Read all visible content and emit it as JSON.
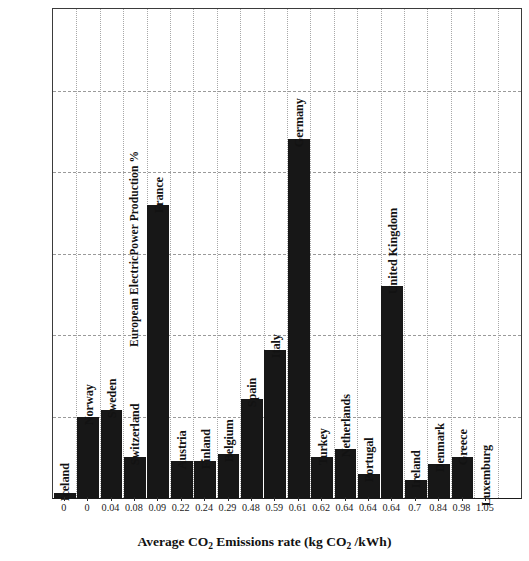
{
  "chart_data": {
    "type": "bar",
    "title": "",
    "xlabel": "Average CO2 Emissions rate (kg CO2 /kWh)",
    "xlabel_parts": {
      "a": "Average CO",
      "sub1": "2",
      "b": " Emissions rate (kg CO",
      "sub2": "2",
      "c": " /kWh)"
    },
    "ylabel": "European ElectricPower Production %",
    "ylim": [
      0,
      30
    ],
    "yticks": [
      0,
      5,
      10,
      15,
      20,
      25,
      30
    ],
    "grid": true,
    "legend": "none",
    "categories": [
      "Iceland",
      "Norway",
      "Sweden",
      "Switzerland",
      "France",
      "Austria",
      "Finland",
      "Belgium",
      "Spain",
      "Italy",
      "Germany",
      "Turkey",
      "Netherlands",
      "Portugal",
      "United Kingdom",
      "Ireland",
      "Denmark",
      "Greece",
      "Luxemburg"
    ],
    "x": [
      "0",
      "0",
      "0.04",
      "0.08",
      "0.09",
      "0.22",
      "0.24",
      "0.29",
      "0.48",
      "0.59",
      "0.61",
      "0.62",
      "0.64",
      "0.64",
      "0.64",
      "0.7",
      "0.84",
      "0.98",
      "1.05"
    ],
    "values": [
      0.3,
      5.0,
      5.4,
      2.5,
      18.0,
      2.3,
      2.3,
      2.7,
      6.1,
      9.1,
      22.0,
      2.5,
      3.0,
      1.5,
      13.0,
      1.1,
      2.1,
      2.5,
      0.0
    ],
    "bar_color": "#171717",
    "series_name": "European ElectricPower Production %"
  }
}
